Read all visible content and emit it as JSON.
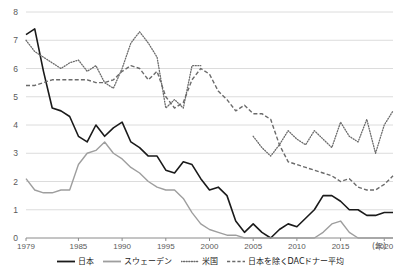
{
  "chart_data": {
    "type": "line",
    "title": "",
    "xlabel": "(年)",
    "ylabel": "",
    "xlim": [
      1979,
      2021
    ],
    "ylim": [
      0,
      8
    ],
    "grid": true,
    "legend_position": "bottom",
    "x_ticks": [
      "1979",
      "1985",
      "1990",
      "1995",
      "2000",
      "2005",
      "2010",
      "2015",
      "2020"
    ],
    "x_tick_values": [
      1979,
      1985,
      1990,
      1995,
      2000,
      2005,
      2010,
      2015,
      2020
    ],
    "y_ticks": [
      "0",
      "1",
      "2",
      "3",
      "4",
      "5",
      "6",
      "7",
      "8"
    ],
    "y_tick_values": [
      0,
      1,
      2,
      3,
      4,
      5,
      6,
      7,
      8
    ],
    "x": [
      1979,
      1980,
      1981,
      1982,
      1983,
      1984,
      1985,
      1986,
      1987,
      1988,
      1989,
      1990,
      1991,
      1992,
      1993,
      1994,
      1995,
      1996,
      1997,
      1998,
      1999,
      2000,
      2001,
      2002,
      2003,
      2004,
      2005,
      2006,
      2007,
      2008,
      2009,
      2010,
      2011,
      2012,
      2013,
      2014,
      2015,
      2016,
      2017,
      2018,
      2019,
      2020,
      2021
    ],
    "series": [
      {
        "name": "日本",
        "color": "#1a1a1a",
        "style": "solid",
        "values": [
          7.2,
          7.4,
          5.9,
          4.6,
          4.5,
          4.3,
          3.6,
          3.4,
          4.0,
          3.6,
          3.9,
          4.1,
          3.4,
          3.2,
          2.9,
          2.9,
          2.4,
          2.3,
          2.7,
          2.6,
          2.1,
          1.7,
          1.8,
          1.5,
          0.6,
          0.2,
          0.5,
          0.2,
          0.0,
          0.3,
          0.5,
          0.4,
          0.7,
          1.0,
          1.5,
          1.5,
          1.3,
          1.0,
          1.0,
          0.8,
          0.8,
          0.9,
          0.9
        ]
      },
      {
        "name": "スウェーデン",
        "color": "#9e9e9e",
        "style": "solid",
        "values": [
          2.1,
          1.7,
          1.6,
          1.6,
          1.7,
          1.7,
          2.6,
          3.0,
          3.1,
          3.4,
          3.0,
          2.8,
          2.5,
          2.3,
          2.0,
          1.8,
          1.7,
          1.7,
          1.4,
          0.9,
          0.5,
          0.3,
          0.2,
          0.1,
          0.1,
          0.0,
          0.0,
          0.0,
          0.0,
          0.0,
          0.0,
          0.0,
          0.0,
          0.0,
          0.2,
          0.5,
          0.6,
          0.2,
          0.0,
          0.0,
          0.0,
          0.0,
          0.0
        ]
      },
      {
        "name": "米国",
        "color": "#6b6b6b",
        "style": "dotted",
        "values": [
          7.0,
          6.6,
          6.4,
          6.2,
          6.0,
          6.2,
          6.3,
          5.9,
          6.1,
          5.5,
          5.3,
          6.0,
          6.9,
          7.3,
          6.9,
          6.4,
          4.6,
          4.9,
          4.6,
          6.1,
          6.1,
          null,
          null,
          null,
          null,
          null,
          3.6,
          3.2,
          2.9,
          3.3,
          3.8,
          3.5,
          3.3,
          3.8,
          3.5,
          3.2,
          4.1,
          3.6,
          3.4,
          4.2,
          3.0,
          4.0,
          4.5
        ]
      },
      {
        "name": "日本を除くDACドナー平均",
        "color": "#6b6b6b",
        "style": "dashed",
        "values": [
          5.4,
          5.4,
          5.5,
          5.6,
          5.6,
          5.6,
          5.6,
          5.6,
          5.5,
          5.5,
          5.6,
          5.9,
          6.1,
          6.0,
          5.6,
          5.9,
          5.0,
          4.6,
          4.8,
          5.6,
          6.0,
          5.8,
          5.2,
          4.9,
          4.5,
          4.7,
          4.4,
          4.4,
          4.2,
          3.3,
          2.7,
          2.6,
          2.5,
          2.4,
          2.3,
          2.2,
          2.0,
          2.1,
          1.8,
          1.7,
          1.7,
          1.9,
          2.2
        ]
      }
    ]
  },
  "axis": {
    "x_unit_label": "(年)"
  }
}
